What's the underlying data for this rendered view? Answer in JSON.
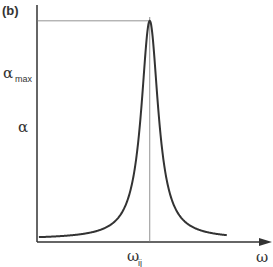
{
  "chart_data": {
    "type": "line",
    "panel_label": "(b)",
    "title": "",
    "xlabel": "ω",
    "ylabel": "α",
    "x_ticks": [
      {
        "label": "ω",
        "sub": "ij",
        "value": 0
      }
    ],
    "y_ticks": [
      {
        "label": "α",
        "sub": "max",
        "value": 1
      }
    ],
    "xlim": [
      -6,
      6.4
    ],
    "ylim": [
      0,
      1.1
    ],
    "grid": false,
    "legend": "none",
    "series": [
      {
        "name": "α(ω) Lorentzian absorption line",
        "shape": "lorentzian",
        "center": 0,
        "peak": 1,
        "half_width": 0.55,
        "x_range": [
          -5.9,
          4.1
        ]
      }
    ],
    "guides": [
      {
        "type": "horizontal",
        "label": "α_max",
        "at_y": 1
      },
      {
        "type": "vertical",
        "label": "ω_ij",
        "at_x": 0
      }
    ]
  }
}
